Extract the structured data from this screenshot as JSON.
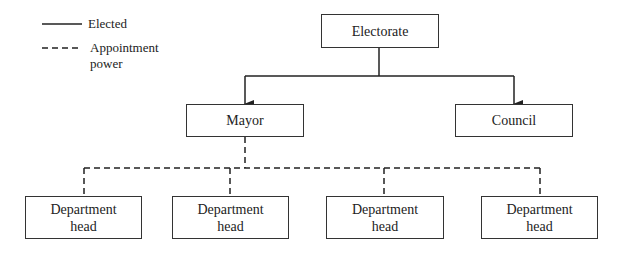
{
  "legend": {
    "elected_label": "Elected",
    "appointment_label_line1": "Appointment",
    "appointment_label_line2": "power"
  },
  "nodes": {
    "electorate": "Electorate",
    "mayor": "Mayor",
    "council": "Council",
    "department_heads": [
      {
        "line1": "Department",
        "line2": "head"
      },
      {
        "line1": "Department",
        "line2": "head"
      },
      {
        "line1": "Department",
        "line2": "head"
      },
      {
        "line1": "Department",
        "line2": "head"
      }
    ]
  },
  "edges": [
    {
      "from": "electorate",
      "to": "mayor",
      "type": "elected"
    },
    {
      "from": "electorate",
      "to": "council",
      "type": "elected"
    },
    {
      "from": "mayor",
      "to": "department_heads.0",
      "type": "appointment"
    },
    {
      "from": "mayor",
      "to": "department_heads.1",
      "type": "appointment"
    },
    {
      "from": "mayor",
      "to": "department_heads.2",
      "type": "appointment"
    },
    {
      "from": "mayor",
      "to": "department_heads.3",
      "type": "appointment"
    }
  ]
}
